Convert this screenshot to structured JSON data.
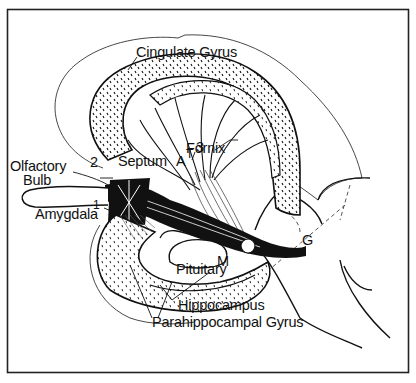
{
  "figure": {
    "type": "anatomical-diagram",
    "colors": {
      "ink": "#111111",
      "background": "#ffffff",
      "frame": "#222222"
    },
    "labels": {
      "cingulate_gyrus": "Cingulate Gyrus",
      "fornix": "Fornix",
      "olfactory_bulb_line1": "Olfactory",
      "olfactory_bulb_line2": "Bulb",
      "septum": "Septum",
      "amygdala": "Amygdala",
      "pituitary": "Pituitary",
      "hippocampus": "Hippocampus",
      "parahippocampal_gyrus": "Parahippocampal Gyrus",
      "marker_1": "1",
      "marker_2": "2",
      "marker_3": "3",
      "marker_A": "A",
      "marker_T": "T",
      "marker_M": "M",
      "marker_G": "G"
    }
  }
}
